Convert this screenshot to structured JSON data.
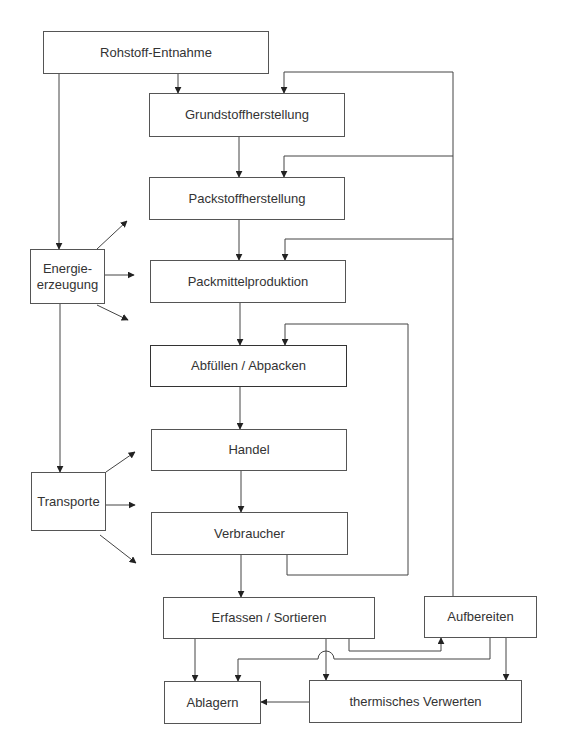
{
  "diagram": {
    "nodes": {
      "rohstoff": {
        "label": "Rohstoff-Entnahme"
      },
      "grundstoff": {
        "label": "Grundstoffherstellung"
      },
      "packstoff": {
        "label": "Packstoffherstellung"
      },
      "packmittel": {
        "label": "Packmittelproduktion"
      },
      "abfuellen": {
        "label": "Abfüllen / Abpacken"
      },
      "handel": {
        "label": "Handel"
      },
      "verbraucher": {
        "label": "Verbraucher"
      },
      "erfassen": {
        "label": "Erfassen / Sortieren"
      },
      "aufbereiten": {
        "label": "Aufbereiten"
      },
      "ablagern": {
        "label": "Ablagern"
      },
      "thermisch": {
        "label": "thermisches Verwerten"
      },
      "energie": {
        "label_line1": "Energie-",
        "label_line2": "erzeugung"
      },
      "transporte": {
        "label": "Transporte"
      }
    },
    "edges": [
      [
        "Rohstoff-Entnahme",
        "Grundstoffherstellung"
      ],
      [
        "Rohstoff-Entnahme",
        "Energieerzeugung"
      ],
      [
        "Grundstoffherstellung",
        "Packstoffherstellung"
      ],
      [
        "Packstoffherstellung",
        "Packmittelproduktion"
      ],
      [
        "Packmittelproduktion",
        "Abfüllen / Abpacken"
      ],
      [
        "Abfüllen / Abpacken",
        "Handel"
      ],
      [
        "Handel",
        "Verbraucher"
      ],
      [
        "Verbraucher",
        "Erfassen / Sortieren"
      ],
      [
        "Verbraucher",
        "Abfüllen / Abpacken"
      ],
      [
        "Energieerzeugung",
        "Transporte"
      ],
      [
        "Aufbereiten",
        "Grundstoffherstellung"
      ],
      [
        "Aufbereiten",
        "Packstoffherstellung"
      ],
      [
        "Aufbereiten",
        "Packmittelproduktion"
      ],
      [
        "Erfassen / Sortieren",
        "Aufbereiten"
      ],
      [
        "Erfassen / Sortieren",
        "Ablagern"
      ],
      [
        "Erfassen / Sortieren",
        "thermisches Verwerten"
      ],
      [
        "Aufbereiten",
        "Ablagern"
      ],
      [
        "Aufbereiten",
        "thermisches Verwerten"
      ],
      [
        "thermisches Verwerten",
        "Ablagern"
      ]
    ]
  }
}
